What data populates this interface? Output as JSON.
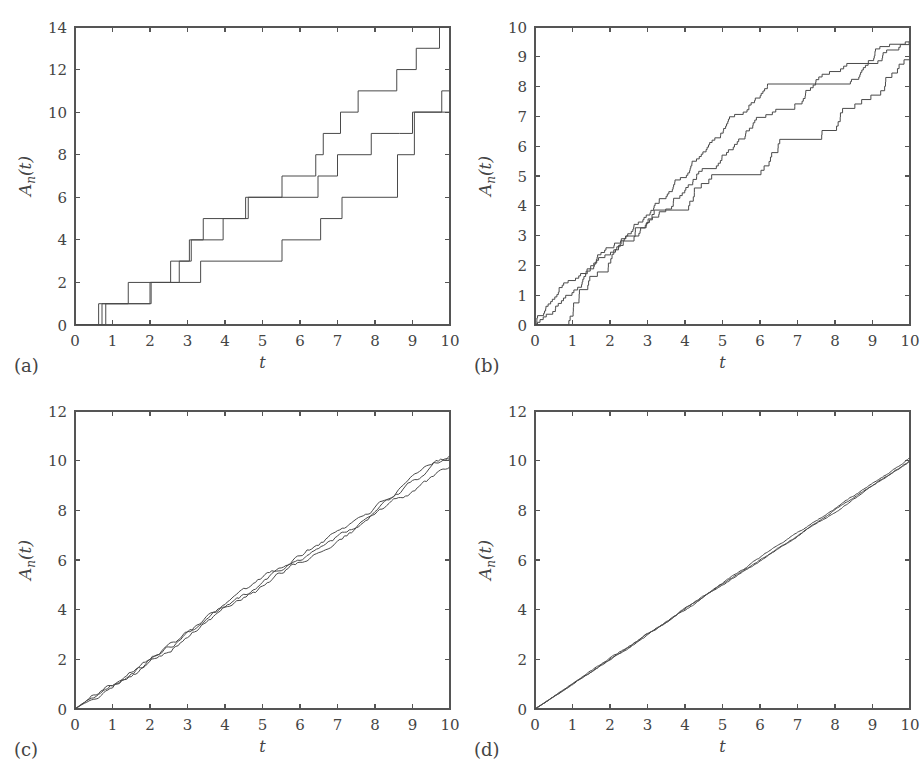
{
  "figure": {
    "width": 920,
    "height": 768,
    "background": "#ffffff",
    "line_color": "#4a4a4a",
    "axis_color": "#555555",
    "text_color": "#444444"
  },
  "panels": [
    {
      "letter": "(a)",
      "xlabel": "t",
      "ylabel": "A_n(t)",
      "ylabel_parts": {
        "main": "A",
        "sub": "n",
        "paren": "(t)"
      }
    },
    {
      "letter": "(b)",
      "xlabel": "t",
      "ylabel": "A_n(t)",
      "ylabel_parts": {
        "main": "A",
        "sub": "n",
        "paren": "(t)"
      }
    },
    {
      "letter": "(c)",
      "xlabel": "t",
      "ylabel": "A_n(t)",
      "ylabel_parts": {
        "main": "A",
        "sub": "n",
        "paren": "(t)"
      }
    },
    {
      "letter": "(d)",
      "xlabel": "t",
      "ylabel": "A_n(t)",
      "ylabel_parts": {
        "main": "A",
        "sub": "n",
        "paren": "(t)"
      }
    }
  ],
  "chart_data": [
    {
      "panel": "(a)",
      "type": "line",
      "title": "",
      "xlabel": "t",
      "ylabel": "A_n(t)",
      "xlim": [
        0,
        10
      ],
      "ylim": [
        0,
        14
      ],
      "xticks": [
        0,
        1,
        2,
        3,
        4,
        5,
        6,
        7,
        8,
        9,
        10
      ],
      "yticks": [
        0,
        2,
        4,
        6,
        8,
        10,
        12,
        14
      ],
      "xticklabels": [
        "0",
        "1",
        "2",
        "3",
        "4",
        "5",
        "6",
        "7",
        "8",
        "9",
        "10"
      ],
      "yticklabels": [
        "0",
        "2",
        "4",
        "6",
        "8",
        "10",
        "12",
        "14"
      ],
      "grid": false,
      "legend": "none",
      "step_style": "post",
      "series": [
        {
          "name": "n=1 path A",
          "jump_times": [
            0.63,
            2.03,
            2.78,
            3.05,
            3.42,
            4.62,
            5.52,
            6.42,
            6.62,
            7.08,
            7.55,
            8.58,
            9.1,
            9.72
          ],
          "values_after": [
            1,
            2,
            3,
            4,
            5,
            6,
            7,
            8,
            9,
            10,
            11,
            12,
            13,
            14
          ],
          "final_value": 14
        },
        {
          "name": "n=1 path B",
          "jump_times": [
            0.72,
            1.42,
            2.55,
            3.1,
            3.95,
            4.55,
            5.6,
            6.48,
            7.0,
            7.9,
            8.65,
            9.0,
            9.78
          ],
          "values_after": [
            1,
            2,
            3,
            4,
            5,
            6,
            6,
            7,
            8,
            9,
            9,
            10,
            11
          ],
          "final_value": 11
        },
        {
          "name": "n=1 path C",
          "jump_times": [
            0.82,
            2.0,
            3.35,
            5.52,
            6.55,
            7.12,
            8.6,
            9.05
          ],
          "values_after": [
            1,
            2,
            3,
            4,
            5,
            6,
            8,
            10
          ],
          "final_value": 10
        }
      ]
    },
    {
      "panel": "(b)",
      "type": "line",
      "title": "",
      "xlabel": "t",
      "ylabel": "A_n(t)",
      "xlim": [
        0,
        10
      ],
      "ylim": [
        0,
        10
      ],
      "xticks": [
        0,
        1,
        2,
        3,
        4,
        5,
        6,
        7,
        8,
        9,
        10
      ],
      "yticks": [
        0,
        1,
        2,
        3,
        4,
        5,
        6,
        7,
        8,
        9,
        10
      ],
      "xticklabels": [
        "0",
        "1",
        "2",
        "3",
        "4",
        "5",
        "6",
        "7",
        "8",
        "9",
        "10"
      ],
      "yticklabels": [
        "0",
        "1",
        "2",
        "3",
        "4",
        "5",
        "6",
        "7",
        "8",
        "9",
        "10"
      ],
      "grid": false,
      "legend": "none",
      "step_style": "post",
      "note": "three staircase paths, finer steps (~0.1 increments), endpoints 9.5, 9.5, 8.9",
      "series": [
        {
          "name": "path 1 (upper)",
          "final_value": 9.5,
          "plateau": [
            6.4,
            8.3,
            9.4
          ]
        },
        {
          "name": "path 2 (middle)",
          "final_value": 9.5,
          "plateau": [
            6.3,
            8.3,
            7.8
          ]
        },
        {
          "name": "path 3 (lower)",
          "final_value": 8.9,
          "plateau": [
            4.8,
            5.6,
            5.1
          ]
        }
      ]
    },
    {
      "panel": "(c)",
      "type": "line",
      "title": "",
      "xlabel": "t",
      "ylabel": "A_n(t)",
      "xlim": [
        0,
        10
      ],
      "ylim": [
        0,
        12
      ],
      "xticks": [
        0,
        1,
        2,
        3,
        4,
        5,
        6,
        7,
        8,
        9,
        10
      ],
      "yticks": [
        0,
        2,
        4,
        6,
        8,
        10,
        12
      ],
      "xticklabels": [
        "0",
        "1",
        "2",
        "3",
        "4",
        "5",
        "6",
        "7",
        "8",
        "9",
        "10"
      ],
      "yticklabels": [
        "0",
        "2",
        "4",
        "6",
        "8",
        "10",
        "12"
      ],
      "grid": false,
      "legend": "none",
      "note": "three nearly-linear noisy paths with slope ~1, endpoints 10.2, 10.1, 9.75",
      "series": [
        {
          "name": "path 1",
          "final_value": 10.2
        },
        {
          "name": "path 2",
          "final_value": 10.05
        },
        {
          "name": "path 3",
          "final_value": 9.75
        }
      ]
    },
    {
      "panel": "(d)",
      "type": "line",
      "title": "",
      "xlabel": "t",
      "ylabel": "A_n(t)",
      "xlim": [
        0,
        10
      ],
      "ylim": [
        0,
        12
      ],
      "xticks": [
        0,
        1,
        2,
        3,
        4,
        5,
        6,
        7,
        8,
        9,
        10
      ],
      "yticks": [
        0,
        2,
        4,
        6,
        8,
        10,
        12
      ],
      "xticklabels": [
        "0",
        "1",
        "2",
        "3",
        "4",
        "5",
        "6",
        "7",
        "8",
        "9",
        "10"
      ],
      "yticklabels": [
        "0",
        "2",
        "4",
        "6",
        "8",
        "10",
        "12"
      ],
      "grid": false,
      "legend": "none",
      "note": "three essentially coincident linear paths slope ~1, endpoints 10.1, 10.0, 9.95",
      "series": [
        {
          "name": "path 1",
          "final_value": 10.1
        },
        {
          "name": "path 2",
          "final_value": 10.0
        },
        {
          "name": "path 3",
          "final_value": 9.95
        }
      ]
    }
  ]
}
